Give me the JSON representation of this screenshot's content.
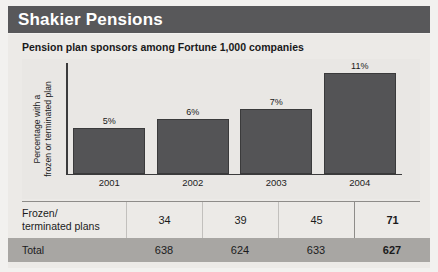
{
  "title": "Shakier Pensions",
  "subtitle": "Pension plan sponsors among Fortune 1,000 companies",
  "chart_data": {
    "type": "bar",
    "title": "Pension plan sponsors among Fortune 1,000 companies",
    "categories": [
      "2001",
      "2002",
      "2003",
      "2004"
    ],
    "values": [
      5,
      6,
      7,
      11
    ],
    "value_labels": [
      "5%",
      "6%",
      "7%",
      "11%"
    ],
    "xlabel": "",
    "ylabel": "Percentage with a frozen or terminated plan",
    "ylim": [
      0,
      12
    ],
    "grid": false,
    "legend": "none",
    "bar_color": "#545456"
  },
  "ylabel_line1": "Percentage with a",
  "ylabel_line2": "frozen or terminated plan",
  "table": {
    "rows": [
      {
        "label_line1": "Frozen/",
        "label_line2": "terminated plans",
        "values": [
          "34",
          "39",
          "45",
          "71"
        ]
      },
      {
        "label_line1": "Total",
        "label_line2": "",
        "values": [
          "638",
          "624",
          "633",
          "627"
        ]
      }
    ]
  },
  "colors": {
    "title_band": "#58585a",
    "panel": "#eceae7",
    "bar": "#545456",
    "total_row": "#a8a6a3"
  }
}
